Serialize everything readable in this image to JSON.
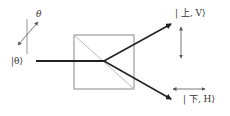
{
  "diagram": {
    "type": "polarizing-beam-splitter",
    "input_state": "|θ⟩",
    "input_angle_label": "θ",
    "outputs": [
      {
        "label": "| 上, V⟩",
        "direction": "up",
        "polarization": "vertical"
      },
      {
        "label": "| 下, H⟩",
        "direction": "down",
        "polarization": "horizontal"
      }
    ]
  },
  "colors": {
    "beam": "#222222",
    "box": "#888888",
    "diagonal": "#bbbbbb",
    "pol_arrow": "#555555"
  }
}
